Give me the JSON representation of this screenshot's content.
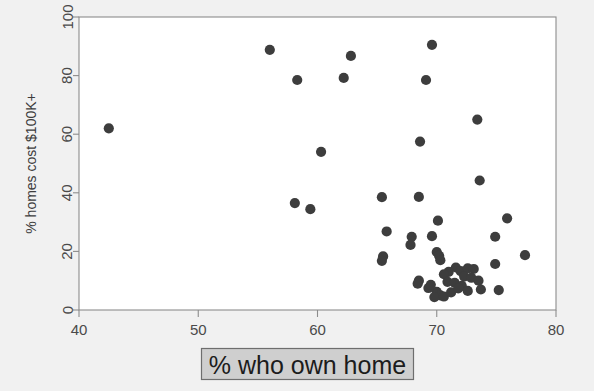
{
  "figure": {
    "background_color": "#f1f1f1",
    "plot_background_color": "#ffffff",
    "frame_color": "#8c8c8c",
    "point_color": "#3d3d3d",
    "xlabel_box_fill": "#cfcfcf",
    "xlabel_box_border": "#6e6e6e"
  },
  "chart_data": {
    "type": "scatter",
    "title": "",
    "xlabel": "% who own home",
    "ylabel": "% homes cost $100K+",
    "xlim": [
      40,
      80
    ],
    "ylim": [
      0,
      100
    ],
    "xticks": [
      40,
      50,
      60,
      70,
      80
    ],
    "yticks": [
      0,
      20,
      40,
      60,
      80,
      100
    ],
    "xtick_labels": [
      "40",
      "50",
      "60",
      "70",
      "80"
    ],
    "ytick_labels": [
      "0",
      "20",
      "40",
      "60",
      "80",
      "100"
    ],
    "grid": false,
    "legend": false,
    "marker": "circle",
    "marker_size": 9,
    "marker_color": "#3d3d3d",
    "points": [
      {
        "x": 42.5,
        "y": 62.0
      },
      {
        "x": 56.0,
        "y": 88.8
      },
      {
        "x": 58.3,
        "y": 78.5
      },
      {
        "x": 62.2,
        "y": 79.2
      },
      {
        "x": 62.8,
        "y": 86.7
      },
      {
        "x": 69.6,
        "y": 90.5
      },
      {
        "x": 69.1,
        "y": 78.5
      },
      {
        "x": 73.4,
        "y": 65.0
      },
      {
        "x": 68.6,
        "y": 57.5
      },
      {
        "x": 60.3,
        "y": 54.0
      },
      {
        "x": 73.6,
        "y": 44.2
      },
      {
        "x": 65.4,
        "y": 38.5
      },
      {
        "x": 68.5,
        "y": 38.6
      },
      {
        "x": 58.1,
        "y": 36.5
      },
      {
        "x": 59.4,
        "y": 34.4
      },
      {
        "x": 75.9,
        "y": 31.3
      },
      {
        "x": 70.1,
        "y": 30.5
      },
      {
        "x": 65.8,
        "y": 26.8
      },
      {
        "x": 74.9,
        "y": 25.0
      },
      {
        "x": 67.9,
        "y": 25.0
      },
      {
        "x": 69.6,
        "y": 25.2
      },
      {
        "x": 67.8,
        "y": 22.2
      },
      {
        "x": 77.4,
        "y": 18.7
      },
      {
        "x": 65.5,
        "y": 18.3
      },
      {
        "x": 65.4,
        "y": 16.8
      },
      {
        "x": 70.0,
        "y": 19.8
      },
      {
        "x": 70.2,
        "y": 18.5
      },
      {
        "x": 70.3,
        "y": 17.0
      },
      {
        "x": 74.9,
        "y": 15.7
      },
      {
        "x": 71.6,
        "y": 14.5
      },
      {
        "x": 72.0,
        "y": 13.3
      },
      {
        "x": 72.6,
        "y": 14.2
      },
      {
        "x": 73.1,
        "y": 14.0
      },
      {
        "x": 71.0,
        "y": 13.0
      },
      {
        "x": 70.6,
        "y": 12.2
      },
      {
        "x": 72.3,
        "y": 11.4
      },
      {
        "x": 72.9,
        "y": 11.0
      },
      {
        "x": 73.5,
        "y": 10.0
      },
      {
        "x": 68.5,
        "y": 10.0
      },
      {
        "x": 68.4,
        "y": 9.0
      },
      {
        "x": 70.9,
        "y": 9.6
      },
      {
        "x": 71.5,
        "y": 9.3
      },
      {
        "x": 72.1,
        "y": 8.2
      },
      {
        "x": 73.7,
        "y": 7.0
      },
      {
        "x": 75.2,
        "y": 6.8
      },
      {
        "x": 70.0,
        "y": 6.2
      },
      {
        "x": 70.3,
        "y": 5.0
      },
      {
        "x": 69.8,
        "y": 4.4
      },
      {
        "x": 70.6,
        "y": 4.6
      },
      {
        "x": 71.2,
        "y": 6.0
      },
      {
        "x": 69.3,
        "y": 7.5
      },
      {
        "x": 69.5,
        "y": 8.6
      },
      {
        "x": 71.8,
        "y": 7.4
      },
      {
        "x": 72.6,
        "y": 6.5
      }
    ]
  }
}
